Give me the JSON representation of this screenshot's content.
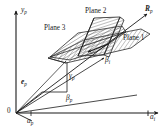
{
  "figure": {
    "background": "#ffffff",
    "line_color": "#1a1a1a",
    "hatch_color": "#555555",
    "plane_fill": "#ffffff",
    "width": 167,
    "height": 131
  },
  "axes": {
    "vertical": {
      "label": "y",
      "sub": "p",
      "name": "y-axis"
    },
    "horizontal": {
      "label": "a",
      "sub": "i",
      "name": "a-i-axis"
    },
    "depth": {
      "label": "a",
      "sub": "p",
      "name": "a-p-axis"
    },
    "origin": {
      "label": "0"
    }
  },
  "planes": [
    {
      "id": "plane1",
      "label": "Plane 1"
    },
    {
      "id": "plane2",
      "label": "Plane 2"
    },
    {
      "id": "plane3",
      "label": "Plane 3"
    }
  ],
  "vectors": [
    {
      "id": "Rp",
      "label": "R",
      "sub": "p",
      "bold": true
    },
    {
      "id": "ep",
      "label": "e",
      "sub": "p",
      "bold": true
    }
  ],
  "angles": [
    {
      "id": "beta_i",
      "label": "β",
      "sub": "i"
    },
    {
      "id": "beta_p",
      "label": "β",
      "sub": "p"
    },
    {
      "id": "gamma_p",
      "label": "γ",
      "sub": "p"
    }
  ]
}
